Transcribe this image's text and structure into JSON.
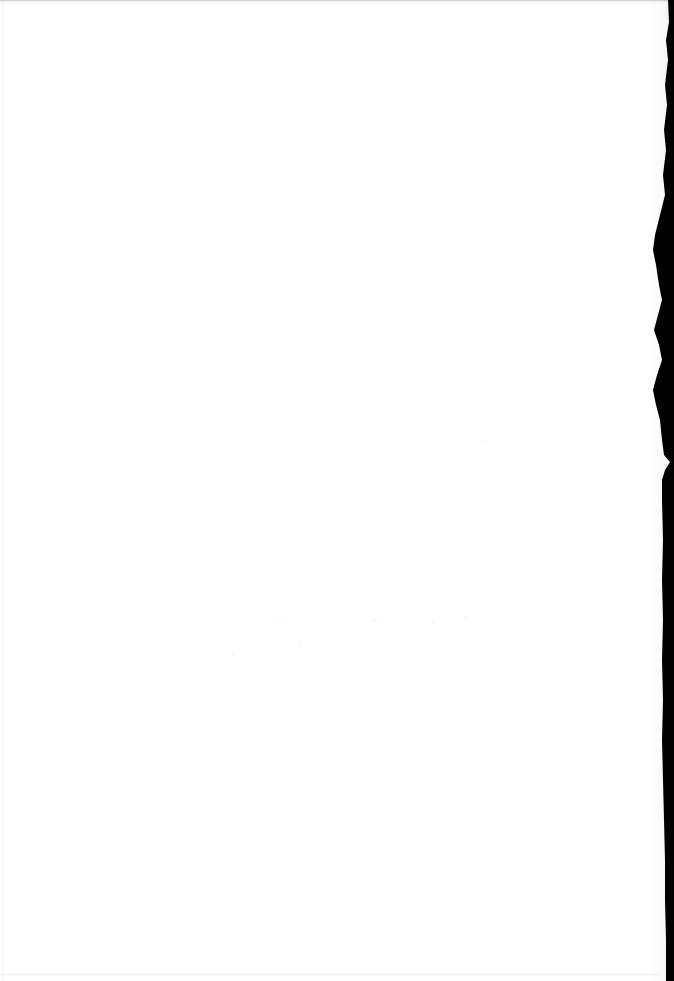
{
  "document": {
    "kind": "scanned-page",
    "page_state": "blank",
    "width_px": 674,
    "height_px": 981,
    "visible_text": "",
    "notes_text": ""
  },
  "surface": {
    "paper_color": "#fefefe",
    "background_color": "#ffffff"
  },
  "artifacts": {
    "top_band_label": "",
    "gutter_label": "",
    "gutter_color": "#000000",
    "platen_line_color": "#f2f2f2",
    "speckle_color": "#fafafa"
  },
  "gutter_profile": {
    "description": "right-edge binding shadow outline, x offsets measured from the right edge of the image",
    "points": [
      {
        "y": 0,
        "x_from_right": 6
      },
      {
        "y": 22,
        "x_from_right": 5
      },
      {
        "y": 40,
        "x_from_right": 8
      },
      {
        "y": 60,
        "x_from_right": 6
      },
      {
        "y": 85,
        "x_from_right": 9
      },
      {
        "y": 105,
        "x_from_right": 7
      },
      {
        "y": 130,
        "x_from_right": 10
      },
      {
        "y": 150,
        "x_from_right": 8
      },
      {
        "y": 175,
        "x_from_right": 11
      },
      {
        "y": 195,
        "x_from_right": 9
      },
      {
        "y": 215,
        "x_from_right": 14
      },
      {
        "y": 235,
        "x_from_right": 19
      },
      {
        "y": 250,
        "x_from_right": 21
      },
      {
        "y": 265,
        "x_from_right": 18
      },
      {
        "y": 285,
        "x_from_right": 15
      },
      {
        "y": 300,
        "x_from_right": 12
      },
      {
        "y": 315,
        "x_from_right": 16
      },
      {
        "y": 330,
        "x_from_right": 20
      },
      {
        "y": 345,
        "x_from_right": 15
      },
      {
        "y": 360,
        "x_from_right": 12
      },
      {
        "y": 375,
        "x_from_right": 17
      },
      {
        "y": 390,
        "x_from_right": 21
      },
      {
        "y": 405,
        "x_from_right": 18
      },
      {
        "y": 420,
        "x_from_right": 14
      },
      {
        "y": 440,
        "x_from_right": 12
      },
      {
        "y": 455,
        "x_from_right": 10
      },
      {
        "y": 462,
        "x_from_right": 4
      },
      {
        "y": 470,
        "x_from_right": 9
      },
      {
        "y": 480,
        "x_from_right": 12
      },
      {
        "y": 500,
        "x_from_right": 12
      },
      {
        "y": 540,
        "x_from_right": 11
      },
      {
        "y": 580,
        "x_from_right": 12
      },
      {
        "y": 620,
        "x_from_right": 11
      },
      {
        "y": 660,
        "x_from_right": 12
      },
      {
        "y": 700,
        "x_from_right": 11
      },
      {
        "y": 740,
        "x_from_right": 12
      },
      {
        "y": 780,
        "x_from_right": 11
      },
      {
        "y": 820,
        "x_from_right": 10
      },
      {
        "y": 860,
        "x_from_right": 9
      },
      {
        "y": 900,
        "x_from_right": 9
      },
      {
        "y": 940,
        "x_from_right": 8
      },
      {
        "y": 981,
        "x_from_right": 8
      }
    ]
  },
  "speckles": [
    {
      "left": 278,
      "top": 618,
      "w": 4,
      "h": 2
    },
    {
      "left": 372,
      "top": 620,
      "w": 5,
      "h": 2
    },
    {
      "left": 432,
      "top": 621,
      "w": 2,
      "h": 3
    },
    {
      "left": 464,
      "top": 617,
      "w": 4,
      "h": 2
    },
    {
      "left": 299,
      "top": 641,
      "w": 2,
      "h": 2
    },
    {
      "left": 232,
      "top": 652,
      "w": 2,
      "h": 4
    },
    {
      "left": 484,
      "top": 440,
      "w": 3,
      "h": 2
    }
  ]
}
